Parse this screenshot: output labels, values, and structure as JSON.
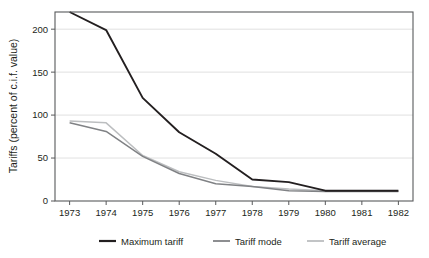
{
  "chart_data": {
    "type": "line",
    "title": "",
    "xlabel": "",
    "ylabel": "Tariffs (percent of c.i.f. value)",
    "x": [
      1973,
      1974,
      1975,
      1976,
      1977,
      1978,
      1979,
      1980,
      1981,
      1982
    ],
    "xtick_labels": [
      "1973",
      "1974",
      "1975",
      "1976",
      "1977",
      "1978",
      "1979",
      "1980",
      "1981",
      "1982"
    ],
    "ytick_labels": [
      "0",
      "50",
      "100",
      "150",
      "200"
    ],
    "yticks": [
      0,
      50,
      100,
      150,
      200
    ],
    "xlim": [
      1972.6,
      1982.4
    ],
    "ylim": [
      0,
      220
    ],
    "grid": "horizontal",
    "legend_position": "bottom",
    "series": [
      {
        "name": "Maximum tariff",
        "color": "#231f20",
        "width": 1.9,
        "values": [
          220,
          199,
          120,
          80,
          55,
          25,
          22,
          12,
          12,
          12
        ]
      },
      {
        "name": "Tariff mode",
        "color": "#808285",
        "width": 1.5,
        "values": [
          91,
          81,
          52,
          32,
          20,
          17,
          12,
          11,
          11,
          11
        ]
      },
      {
        "name": "Tariff average",
        "color": "#bcbec0",
        "width": 1.5,
        "values": [
          93,
          91,
          53,
          34,
          24,
          17,
          14,
          12,
          12,
          12
        ]
      }
    ]
  },
  "legend": {
    "items": [
      {
        "label": "Maximum tariff"
      },
      {
        "label": "Tariff mode"
      },
      {
        "label": "Tariff average"
      }
    ]
  }
}
